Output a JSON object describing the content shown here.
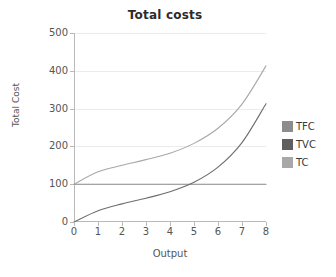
{
  "chart_data": {
    "type": "line",
    "title": "Total costs",
    "xlabel": "Output",
    "ylabel": "Total Cost",
    "xlim": [
      0,
      8
    ],
    "ylim": [
      0,
      500
    ],
    "grid": true,
    "legend_position": "right",
    "x_ticks": [
      "0",
      "1",
      "2",
      "3",
      "4",
      "5",
      "6",
      "7",
      "8"
    ],
    "y_ticks": [
      "0",
      "100",
      "200",
      "300",
      "400",
      "500"
    ],
    "x": [
      0,
      1,
      2,
      3,
      4,
      5,
      6,
      7,
      8
    ],
    "series": [
      {
        "name": "TFC",
        "color": "#8c8c8c",
        "values": [
          100,
          100,
          100,
          100,
          100,
          100,
          100,
          100,
          100
        ]
      },
      {
        "name": "TVC",
        "color": "#6e6e6e",
        "values": [
          0,
          30,
          48,
          63,
          80,
          105,
          145,
          210,
          313
        ]
      },
      {
        "name": "TC",
        "color": "#a8a8a8",
        "values": [
          100,
          133,
          150,
          165,
          182,
          208,
          248,
          312,
          413
        ]
      }
    ]
  },
  "legend": {
    "items": [
      {
        "label": "TFC",
        "color": "#8c8c8c"
      },
      {
        "label": "TVC",
        "color": "#5f5f5f"
      },
      {
        "label": "TC",
        "color": "#a8a8a8"
      }
    ]
  }
}
